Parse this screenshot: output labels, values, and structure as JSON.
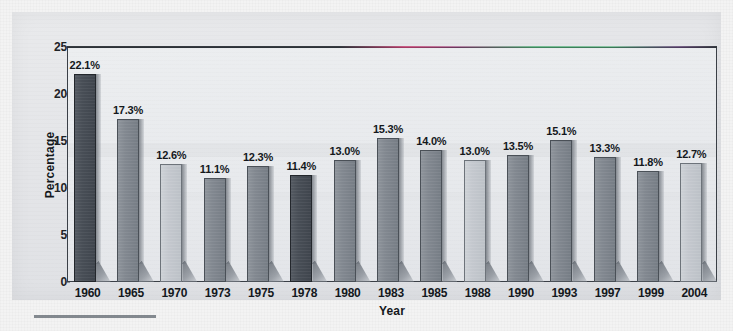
{
  "chart_data": {
    "type": "bar",
    "title": "",
    "xlabel": "Year",
    "ylabel": "Percentage",
    "ylim": [
      0,
      25
    ],
    "yticks": [
      0,
      5,
      10,
      15,
      20,
      25
    ],
    "grid": false,
    "legend": "none",
    "categories": [
      "1960",
      "1965",
      "1970",
      "1973",
      "1975",
      "1978",
      "1980",
      "1983",
      "1985",
      "1988",
      "1990",
      "1993",
      "1997",
      "1999",
      "2004"
    ],
    "values": [
      22.1,
      17.3,
      12.6,
      11.1,
      12.3,
      11.4,
      13.0,
      15.3,
      14.0,
      13.0,
      13.5,
      15.1,
      13.3,
      11.8,
      12.7
    ],
    "value_labels": [
      "22.1%",
      "17.3%",
      "12.6%",
      "11.1%",
      "12.3%",
      "11.4%",
      "13.0%",
      "15.3%",
      "14.0%",
      "13.0%",
      "13.5%",
      "15.1%",
      "13.3%",
      "11.8%",
      "12.7%"
    ],
    "bar_shades": [
      "dark",
      "medium",
      "light",
      "medium",
      "medium",
      "dark",
      "medium",
      "medium",
      "medium",
      "light",
      "medium",
      "medium",
      "medium",
      "medium",
      "light"
    ]
  },
  "axis": {
    "y_title": "Percentage",
    "x_title": "Year",
    "y_tick_labels": [
      "0",
      "5",
      "10",
      "15",
      "20",
      "25"
    ]
  },
  "colors": {
    "bar_dark": "#484e56",
    "bar_medium": "#828890",
    "bar_light": "#c4c8ce",
    "axis": "#3a3f46",
    "text": "#14181c",
    "plot_background": "#e8eaed",
    "page_background": "#e4e5e8"
  }
}
